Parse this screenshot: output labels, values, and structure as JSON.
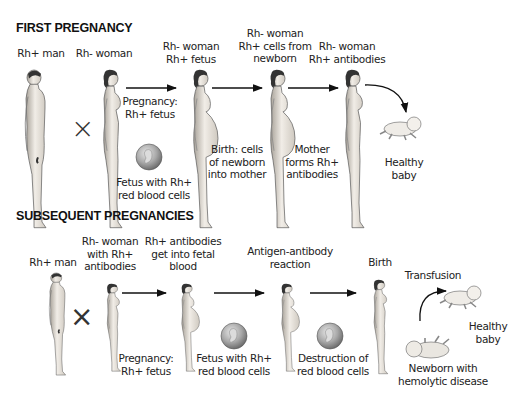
{
  "first": {
    "heading": "FIRST PREGNANCY",
    "labels": {
      "man": [
        "Rh+ man"
      ],
      "woman": [
        "Rh- woman"
      ],
      "stage1": [
        "Rh- woman",
        "Rh+ fetus"
      ],
      "stage2": [
        "Rh- woman",
        "Rh+ cells from",
        "newborn"
      ],
      "stage3": [
        "Rh- woman",
        "Rh+ antibodies"
      ],
      "pregnancy": [
        "Pregnancy:",
        "Rh+ fetus"
      ],
      "fetus": [
        "Fetus with Rh+",
        "red blood cells"
      ],
      "birth": [
        "Birth: cells",
        "of newborn",
        "into mother"
      ],
      "mother": [
        "Mother",
        "forms Rh+",
        "antibodies"
      ],
      "healthy": [
        "Healthy",
        "baby"
      ]
    },
    "cross_symbol": "×"
  },
  "subsequent": {
    "heading": "SUBSEQUENT PREGNANCIES",
    "labels": {
      "man": [
        "Rh+ man"
      ],
      "woman": [
        "Rh- woman",
        "with Rh+",
        "antibodies"
      ],
      "stage1": [
        "Rh+ antibodies",
        "get into fetal",
        "blood"
      ],
      "stage2": [
        "Antigen-antibody",
        "reaction"
      ],
      "stage3": [
        "Birth"
      ],
      "transfusion": [
        "Transfusion"
      ],
      "pregnancy": [
        "Pregnancy:",
        "Rh+ fetus"
      ],
      "fetus": [
        "Fetus with Rh+",
        "red blood cells"
      ],
      "destruction": [
        "Destruction of",
        "red blood cells"
      ],
      "healthy": [
        "Healthy",
        "baby"
      ],
      "newborn": [
        "Newborn with",
        "hemolytic disease"
      ]
    },
    "cross_symbol": "×"
  },
  "colors": {
    "skin": "#ece8e2",
    "skin_shade": "#b9b3aa",
    "outline": "#555555",
    "hair": "#333333",
    "fetus_sphere": "#9a9a9a",
    "arrow": "#111111"
  }
}
